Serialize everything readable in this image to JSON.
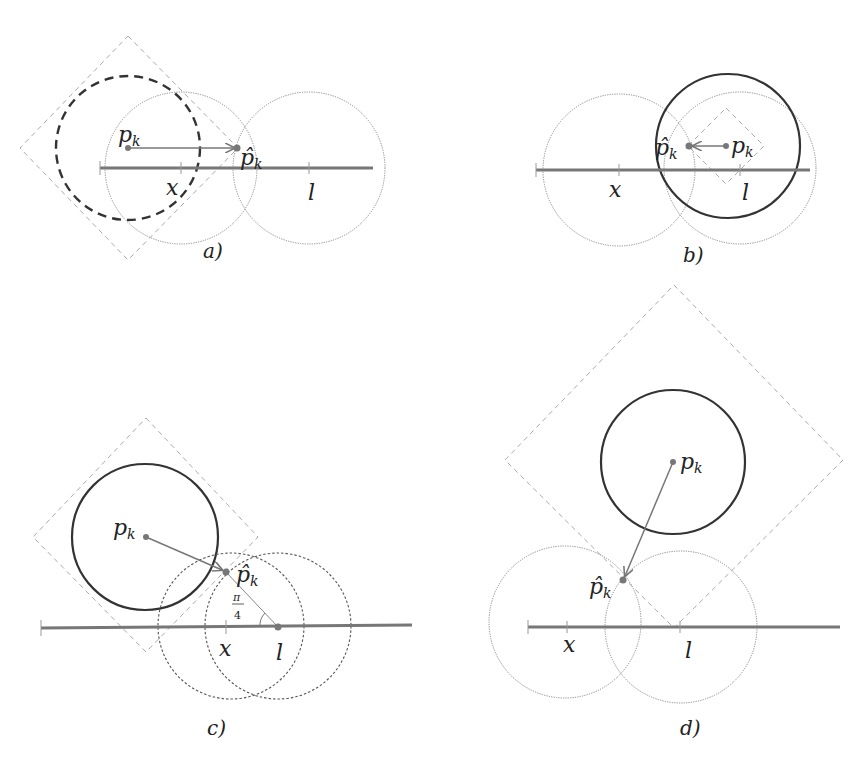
{
  "figure": {
    "panels": [
      {
        "id": "a",
        "caption": "a)",
        "pk_label": "p",
        "pk_sub": "k",
        "phat_label": "p̂",
        "phat_sub": "k",
        "x_label": "x",
        "l_label": "l"
      },
      {
        "id": "b",
        "caption": "b)",
        "pk_label": "p",
        "pk_sub": "k",
        "phat_label": "p̂",
        "phat_sub": "k",
        "x_label": "x",
        "l_label": "l"
      },
      {
        "id": "c",
        "caption": "c)",
        "pk_label": "p",
        "pk_sub": "k",
        "phat_label": "p̂",
        "phat_sub": "k",
        "x_label": "x",
        "l_label": "l",
        "angle_num": "π",
        "angle_den": "4"
      },
      {
        "id": "d",
        "caption": "d)",
        "pk_label": "p",
        "pk_sub": "k",
        "phat_label": "p̂",
        "phat_sub": "k",
        "x_label": "x",
        "l_label": "l"
      }
    ]
  }
}
